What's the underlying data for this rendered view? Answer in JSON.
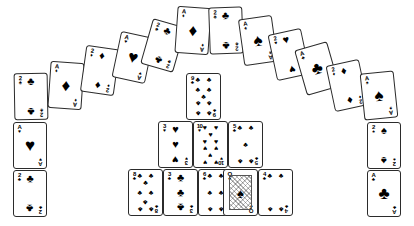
{
  "scene": {
    "title": "Playing card arrangement",
    "background_color": "#ffffff",
    "card_back_color": "#ffffff",
    "card_border_color": "#2b2b2b",
    "suit_glyphs": {
      "spades": "♠",
      "hearts": "♥",
      "diamonds": "♦",
      "clubs": "♣"
    },
    "width": 414,
    "height": 226
  },
  "groups": {
    "arc": "top-arch",
    "left_column": "left-stack",
    "right_column": "right-stack",
    "center": "center-pyramid"
  },
  "cards": [
    {
      "id": "arc-1",
      "group": "arc",
      "rank": "2",
      "suit": "clubs",
      "x": 14,
      "y": 73,
      "w": 34,
      "h": 47,
      "rot": -1
    },
    {
      "id": "arc-2",
      "group": "arc",
      "rank": "A",
      "suit": "diamonds",
      "x": 49,
      "y": 62,
      "w": 34,
      "h": 47,
      "rot": 4
    },
    {
      "id": "arc-3",
      "group": "arc",
      "rank": "2",
      "suit": "diamonds",
      "x": 83,
      "y": 47,
      "w": 34,
      "h": 47,
      "rot": 8
    },
    {
      "id": "arc-4",
      "group": "arc",
      "rank": "A",
      "suit": "hearts",
      "x": 116,
      "y": 34,
      "w": 34,
      "h": 47,
      "rot": 12
    },
    {
      "id": "arc-5",
      "group": "arc",
      "rank": "2",
      "suit": "clubs",
      "x": 146,
      "y": 22,
      "w": 34,
      "h": 47,
      "rot": 16
    },
    {
      "id": "arc-6",
      "group": "arc",
      "rank": "A",
      "suit": "diamonds",
      "x": 176,
      "y": 7,
      "w": 34,
      "h": 47,
      "rot": 4
    },
    {
      "id": "arc-7",
      "group": "arc",
      "rank": "2",
      "suit": "clubs",
      "x": 209,
      "y": 7,
      "w": 34,
      "h": 47,
      "rot": -2
    },
    {
      "id": "arc-8",
      "group": "arc",
      "rank": "A",
      "suit": "spades",
      "x": 241,
      "y": 17,
      "w": 34,
      "h": 47,
      "rot": -8
    },
    {
      "id": "arc-9",
      "group": "arc",
      "rank": "2",
      "suit": "hearts",
      "x": 272,
      "y": 31,
      "w": 34,
      "h": 47,
      "rot": -12
    },
    {
      "id": "arc-10",
      "group": "arc",
      "rank": "A",
      "suit": "clubs",
      "x": 300,
      "y": 45,
      "w": 34,
      "h": 47,
      "rot": -16
    },
    {
      "id": "arc-11",
      "group": "arc",
      "rank": "2",
      "suit": "diamonds",
      "x": 330,
      "y": 62,
      "w": 34,
      "h": 47,
      "rot": -12
    },
    {
      "id": "arc-12",
      "group": "arc",
      "rank": "A",
      "suit": "spades",
      "x": 362,
      "y": 72,
      "w": 34,
      "h": 47,
      "rot": -6
    },
    {
      "id": "left-1",
      "group": "left_column",
      "rank": "A",
      "suit": "hearts",
      "x": 13,
      "y": 122,
      "w": 34,
      "h": 47,
      "rot": 0
    },
    {
      "id": "left-2",
      "group": "left_column",
      "rank": "2",
      "suit": "clubs",
      "x": 13,
      "y": 170,
      "w": 34,
      "h": 47,
      "rot": 0
    },
    {
      "id": "right-1",
      "group": "right_column",
      "rank": "2",
      "suit": "spades",
      "x": 367,
      "y": 122,
      "w": 34,
      "h": 47,
      "rot": 0
    },
    {
      "id": "right-2",
      "group": "right_column",
      "rank": "A",
      "suit": "clubs",
      "x": 367,
      "y": 170,
      "w": 34,
      "h": 47,
      "rot": 0
    },
    {
      "id": "ctr-top",
      "group": "center",
      "rank": "9",
      "suit": "clubs",
      "x": 186,
      "y": 73,
      "w": 35,
      "h": 47,
      "rot": 0
    },
    {
      "id": "ctr-m1",
      "group": "center",
      "rank": "3",
      "suit": "hearts",
      "x": 158,
      "y": 121,
      "w": 35,
      "h": 47,
      "rot": 0
    },
    {
      "id": "ctr-m2",
      "group": "center",
      "rank": "10",
      "suit": "hearts",
      "x": 193,
      "y": 121,
      "w": 35,
      "h": 47,
      "rot": 0
    },
    {
      "id": "ctr-m3",
      "group": "center",
      "rank": "5",
      "suit": "clubs",
      "x": 228,
      "y": 121,
      "w": 35,
      "h": 47,
      "rot": 0
    },
    {
      "id": "ctr-b1",
      "group": "center",
      "rank": "8",
      "suit": "clubs",
      "x": 128,
      "y": 169,
      "w": 35,
      "h": 47,
      "rot": 0
    },
    {
      "id": "ctr-b2",
      "group": "center",
      "rank": "3",
      "suit": "clubs",
      "x": 163,
      "y": 169,
      "w": 35,
      "h": 47,
      "rot": 0
    },
    {
      "id": "ctr-b3",
      "group": "center",
      "rank": "6",
      "suit": "clubs",
      "x": 198,
      "y": 169,
      "w": 35,
      "h": 47,
      "rot": 0
    },
    {
      "id": "ctr-b4",
      "group": "center",
      "rank": "Q",
      "suit": "spades",
      "x": 223,
      "y": 169,
      "w": 35,
      "h": 47,
      "rot": 0,
      "face": true
    },
    {
      "id": "ctr-b5",
      "group": "center",
      "rank": "4",
      "suit": "clubs",
      "x": 258,
      "y": 169,
      "w": 35,
      "h": 47,
      "rot": 0
    }
  ]
}
